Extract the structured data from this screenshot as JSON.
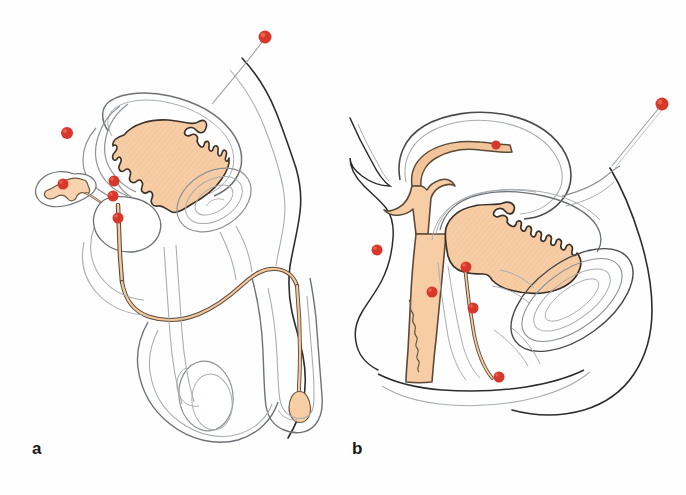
{
  "figure": {
    "background_color": "#fefefe",
    "panels": [
      {
        "id": "panel-a",
        "label": "a",
        "caption_position": {
          "x": 32,
          "y": 440
        },
        "description": "Male pelvis sagittal section: bladder, prostate, seminal vesicle, urethra, penis and testis",
        "marker_count": 6
      },
      {
        "id": "panel-b",
        "label": "b",
        "caption_position": {
          "x": 352,
          "y": 440
        },
        "description": "Female pelvis sagittal section: bladder, uterus, vagina, urethra and rectum",
        "marker_count": 6
      }
    ]
  },
  "colors": {
    "marker_red": "#d8382c",
    "marker_red_highlight": "#e8614f",
    "organ_fill": "#f7cda6",
    "organ_fill_light": "#fadcc0",
    "outline_dark": "#2b2b2b",
    "outline_medium": "#4a4a4a",
    "outline_light": "#8e9296",
    "outline_faint": "#a9adb1",
    "background": "#fefefe",
    "label_text": "#1a1a1a"
  },
  "markers": {
    "legend": "red dot marker",
    "radius_large": 6.5,
    "radius_small": 4.5,
    "panel_a": [
      {
        "name": "marker-a-1",
        "x": 265,
        "y": 37,
        "r": 6.5,
        "leader": {
          "x2": 205,
          "y2": 110
        }
      },
      {
        "name": "marker-a-2",
        "x": 67,
        "y": 133,
        "r": 6.0,
        "leader": null
      },
      {
        "name": "marker-a-3",
        "x": 63,
        "y": 184,
        "r": 5.5,
        "leader": null
      },
      {
        "name": "marker-a-4",
        "x": 114,
        "y": 181,
        "r": 5.5,
        "leader": null
      },
      {
        "name": "marker-a-5",
        "x": 113,
        "y": 196,
        "r": 5.5,
        "leader": null
      },
      {
        "name": "marker-a-6",
        "x": 118,
        "y": 218,
        "r": 5.5,
        "leader": null
      }
    ],
    "panel_b": [
      {
        "name": "marker-b-1",
        "x": 662,
        "y": 104,
        "r": 6.5,
        "leader": {
          "x2": 610,
          "y2": 168
        }
      },
      {
        "name": "marker-b-2",
        "x": 496,
        "y": 145,
        "r": 5.0,
        "leader": null
      },
      {
        "name": "marker-b-3",
        "x": 377,
        "y": 250,
        "r": 5.5,
        "leader": null
      },
      {
        "name": "marker-b-4",
        "x": 466,
        "y": 267,
        "r": 5.5,
        "leader": null
      },
      {
        "name": "marker-b-5",
        "x": 432,
        "y": 292,
        "r": 5.5,
        "leader": null
      },
      {
        "name": "marker-b-6",
        "x": 473,
        "y": 308,
        "r": 5.5,
        "leader": null
      },
      {
        "name": "marker-b-7",
        "x": 499,
        "y": 377,
        "r": 5.5,
        "leader": null
      }
    ]
  }
}
